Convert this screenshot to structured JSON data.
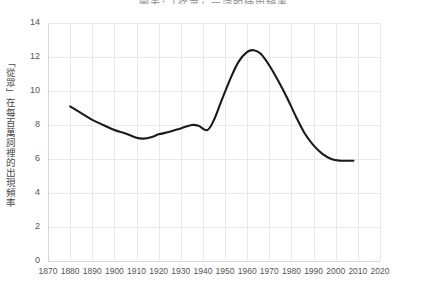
{
  "chart_data": {
    "type": "line",
    "title": "圖表：「從眾」一詞的使用頻率",
    "xlabel": "",
    "ylabel": "「從眾」在每百萬詞裡的出現頻率",
    "xlim": [
      1870,
      2020
    ],
    "ylim": [
      0,
      14
    ],
    "grid": true,
    "legend": "none",
    "xticks": [
      1870,
      1880,
      1890,
      1900,
      1910,
      1920,
      1930,
      1940,
      1950,
      1960,
      1970,
      1980,
      1990,
      2000,
      2010,
      2020
    ],
    "yticks": [
      0,
      2,
      4,
      6,
      8,
      10,
      12,
      14
    ],
    "series": [
      {
        "name": "「從眾」出現頻率",
        "color": "#1b1b1b",
        "x": [
          1880,
          1885,
          1890,
          1895,
          1900,
          1905,
          1910,
          1913,
          1917,
          1920,
          1925,
          1930,
          1935,
          1938,
          1942,
          1945,
          1948,
          1952,
          1956,
          1960,
          1963,
          1966,
          1970,
          1974,
          1978,
          1982,
          1986,
          1990,
          1994,
          1998,
          2002,
          2005,
          2008
        ],
        "y": [
          9.1,
          8.7,
          8.3,
          8.0,
          7.7,
          7.5,
          7.25,
          7.2,
          7.3,
          7.45,
          7.6,
          7.8,
          8.0,
          7.95,
          7.7,
          8.3,
          9.3,
          10.6,
          11.7,
          12.3,
          12.4,
          12.2,
          11.5,
          10.6,
          9.6,
          8.5,
          7.5,
          6.8,
          6.3,
          6.0,
          5.9,
          5.9,
          5.9
        ]
      }
    ]
  },
  "axis": {
    "y_tick_labels": [
      "0",
      "2",
      "4",
      "6",
      "8",
      "10",
      "12",
      "14"
    ],
    "x_tick_labels": [
      "1870",
      "1880",
      "1890",
      "1900",
      "1910",
      "1920",
      "1930",
      "1940",
      "1950",
      "1960",
      "1970",
      "1980",
      "1990",
      "2000",
      "2010",
      "2020"
    ]
  },
  "style": {
    "grid_color": "#e9e9e9",
    "line_color": "#1b1b1b",
    "background": "#ffffff",
    "text_color": "#555555"
  }
}
